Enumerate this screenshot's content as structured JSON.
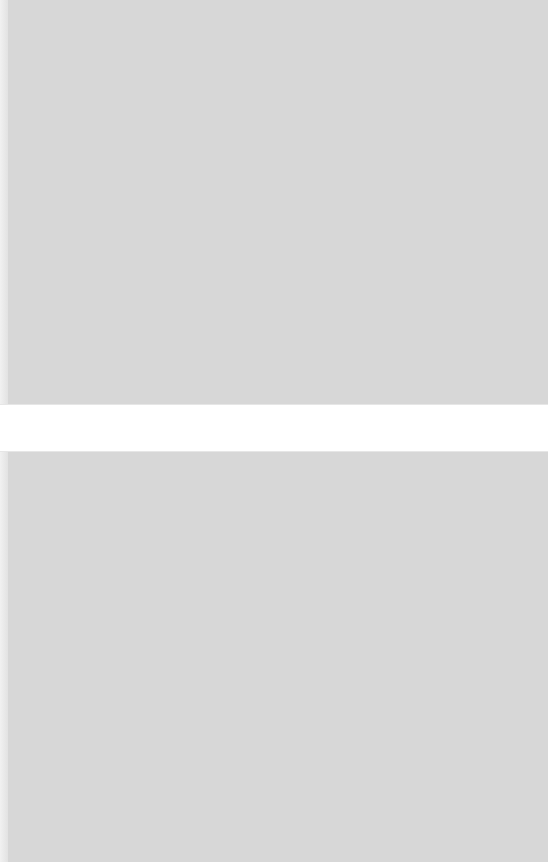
{
  "screen": {
    "state": "blank-overlay",
    "overlay_color": "#d7d7d7",
    "band_color": "#ffffff"
  },
  "band": {
    "label": ""
  }
}
